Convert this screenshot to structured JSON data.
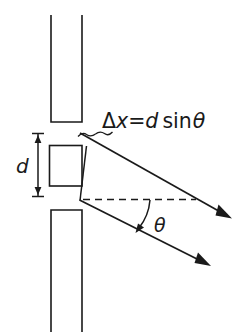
{
  "figure": {
    "title": "Double-slit path difference diagram",
    "labels": {
      "path_difference_delta": "Δ",
      "path_difference_x": "x",
      "path_difference_equals": "=",
      "path_difference_d": "d",
      "path_difference_sin": "sin",
      "path_difference_theta": "θ",
      "path_difference_full": "Δx=d sinθ",
      "slit_separation": "d",
      "angle": "θ"
    },
    "colors": {
      "ink": "#1a1a1a",
      "background": "#ffffff"
    },
    "elements": {
      "upper_barrier_name": "upper barrier plate",
      "slit_block_name": "central slit block",
      "lower_barrier_name": "lower barrier plate",
      "upper_ray_name": "upper diffracted ray",
      "lower_ray_name": "lower diffracted ray",
      "axis_name": "horizontal reference axis",
      "wavefront_name": "wavefront / path-difference segment",
      "angle_arc_name": "angle theta arc",
      "dimension_name": "slit separation dimension"
    },
    "geometry": {
      "upper_barrier": {
        "x": 51,
        "y_top": 15,
        "width": 31,
        "y_bottom": 122
      },
      "slit_block": {
        "x": 49,
        "y": 145,
        "width": 33,
        "height": 41
      },
      "lower_barrier": {
        "x": 51,
        "y_top": 210,
        "width": 31,
        "y_bottom": 332
      },
      "dimension_line": {
        "x": 38,
        "y_top": 133,
        "y_bottom": 197
      },
      "upper_ray": {
        "x1": 85,
        "y1": 146,
        "x2": 228,
        "y2": 216
      },
      "lower_ray": {
        "x1": 80,
        "y1": 200,
        "x2": 207,
        "y2": 264
      },
      "axis_dashed": {
        "x1": 82,
        "y1": 199,
        "x2": 195,
        "y2": 199
      },
      "wavefront": {
        "x1": 86,
        "y1": 147,
        "x2": 80,
        "y2": 200
      },
      "theta_degrees": 26
    }
  }
}
